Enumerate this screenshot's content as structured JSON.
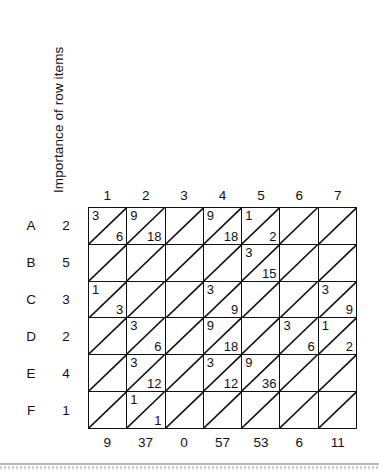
{
  "axis": {
    "vertical_label": "Importance of row items"
  },
  "columns": {
    "headers": [
      "1",
      "2",
      "3",
      "4",
      "5",
      "6",
      "7"
    ],
    "totals": [
      "9",
      "37",
      "0",
      "57",
      "53",
      "6",
      "11"
    ]
  },
  "rows": [
    {
      "letter": "A",
      "weight": "2"
    },
    {
      "letter": "B",
      "weight": "5"
    },
    {
      "letter": "C",
      "weight": "3"
    },
    {
      "letter": "D",
      "weight": "2"
    },
    {
      "letter": "E",
      "weight": "4"
    },
    {
      "letter": "F",
      "weight": "1"
    }
  ],
  "matrix": [
    [
      {
        "top": "3",
        "bottom": "6"
      },
      {
        "top": "9",
        "bottom": "18"
      },
      {
        "top": "",
        "bottom": ""
      },
      {
        "top": "9",
        "bottom": "18"
      },
      {
        "top": "1",
        "bottom": "2"
      },
      {
        "top": "",
        "bottom": ""
      },
      {
        "top": "",
        "bottom": ""
      }
    ],
    [
      {
        "top": "",
        "bottom": ""
      },
      {
        "top": "",
        "bottom": ""
      },
      {
        "top": "",
        "bottom": ""
      },
      {
        "top": "",
        "bottom": ""
      },
      {
        "top": "3",
        "bottom": "15"
      },
      {
        "top": "",
        "bottom": ""
      },
      {
        "top": "",
        "bottom": ""
      }
    ],
    [
      {
        "top": "1",
        "bottom": "3"
      },
      {
        "top": "",
        "bottom": ""
      },
      {
        "top": "",
        "bottom": ""
      },
      {
        "top": "3",
        "bottom": "9"
      },
      {
        "top": "",
        "bottom": ""
      },
      {
        "top": "",
        "bottom": ""
      },
      {
        "top": "3",
        "bottom": "9"
      }
    ],
    [
      {
        "top": "",
        "bottom": ""
      },
      {
        "top": "3",
        "bottom": "6"
      },
      {
        "top": "",
        "bottom": ""
      },
      {
        "top": "9",
        "bottom": "18"
      },
      {
        "top": "",
        "bottom": ""
      },
      {
        "top": "3",
        "bottom": "6"
      },
      {
        "top": "1",
        "bottom": "2"
      }
    ],
    [
      {
        "top": "",
        "bottom": ""
      },
      {
        "top": "3",
        "bottom": "12"
      },
      {
        "top": "",
        "bottom": ""
      },
      {
        "top": "3",
        "bottom": "12"
      },
      {
        "top": "9",
        "bottom": "36"
      },
      {
        "top": "",
        "bottom": ""
      },
      {
        "top": "",
        "bottom": ""
      }
    ],
    [
      {
        "top": "",
        "bottom": ""
      },
      {
        "top": "1",
        "bottom": "1"
      },
      {
        "top": "",
        "bottom": ""
      },
      {
        "top": "",
        "bottom": ""
      },
      {
        "top": "",
        "bottom": ""
      },
      {
        "top": "",
        "bottom": ""
      },
      {
        "top": "",
        "bottom": ""
      }
    ]
  ],
  "chart_data": {
    "type": "table",
    "title": "",
    "xlabel": "",
    "ylabel": "Importance of row items",
    "row_labels": [
      "A",
      "B",
      "C",
      "D",
      "E",
      "F"
    ],
    "row_weights": [
      2,
      5,
      3,
      2,
      4,
      1
    ],
    "column_labels": [
      "1",
      "2",
      "3",
      "4",
      "5",
      "6",
      "7"
    ],
    "cell_notation": "each cell split by a diagonal: upper-left = relationship strength, lower-right = weighted score (strength x row importance)",
    "strengths": [
      [
        3,
        9,
        null,
        9,
        1,
        null,
        null
      ],
      [
        null,
        null,
        null,
        null,
        3,
        null,
        null
      ],
      [
        1,
        null,
        null,
        3,
        null,
        null,
        3
      ],
      [
        null,
        3,
        null,
        9,
        null,
        3,
        1
      ],
      [
        null,
        3,
        null,
        3,
        9,
        null,
        null
      ],
      [
        null,
        1,
        null,
        null,
        null,
        null,
        null
      ]
    ],
    "weighted": [
      [
        6,
        18,
        null,
        18,
        2,
        null,
        null
      ],
      [
        null,
        null,
        null,
        null,
        15,
        null,
        null
      ],
      [
        3,
        null,
        null,
        9,
        null,
        null,
        9
      ],
      [
        null,
        6,
        null,
        18,
        null,
        6,
        2
      ],
      [
        null,
        12,
        null,
        12,
        36,
        null,
        null
      ],
      [
        null,
        1,
        null,
        null,
        null,
        null,
        null
      ]
    ],
    "column_totals": [
      9,
      37,
      0,
      57,
      53,
      6,
      11
    ],
    "grid": true,
    "legend": "none"
  }
}
